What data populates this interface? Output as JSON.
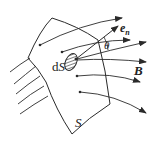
{
  "diagram": {
    "type": "magnetic flux through surface",
    "labels": {
      "surface": "S",
      "area_element_d": "d",
      "area_element_S": "S",
      "normal_vector": "e",
      "normal_subscript": "n",
      "angle": "θ",
      "field": "B"
    },
    "colors": {
      "stroke": "#2a2a2a",
      "background": "#ffffff"
    }
  }
}
